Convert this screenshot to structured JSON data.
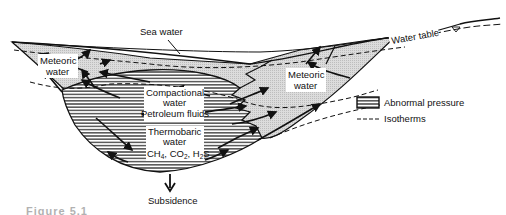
{
  "figure": {
    "type": "geologic-cross-section",
    "labels": {
      "sea_water": "Sea water",
      "water_table": "Water table",
      "meteoric_left": [
        "Meteoric",
        "water"
      ],
      "meteoric_right": [
        "Meteoric",
        "water"
      ],
      "compactional": [
        "Compactional",
        "water"
      ],
      "petroleum": "Petroleum fluids",
      "thermobaric": [
        "Thermobaric",
        "water"
      ],
      "gases": "CH4, CO2, H2S",
      "subsidence": "Subsidence"
    },
    "legend": [
      {
        "symbol": "horizontal-hatch-box",
        "label": "Abnormal pressure"
      },
      {
        "symbol": "dashed-line",
        "label": "Isotherms"
      }
    ],
    "caption_partial": "Figure 5.1"
  },
  "colors": {
    "ink": "#111111",
    "meteoric_fill": "#d6d6d6",
    "background": "#ffffff"
  }
}
